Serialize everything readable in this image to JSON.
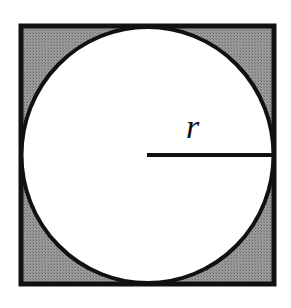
{
  "diagram": {
    "radius_label": "r",
    "colors": {
      "square_fill": "#8c8c8c",
      "circle_fill": "#ffffff",
      "stroke": "#111111"
    }
  }
}
